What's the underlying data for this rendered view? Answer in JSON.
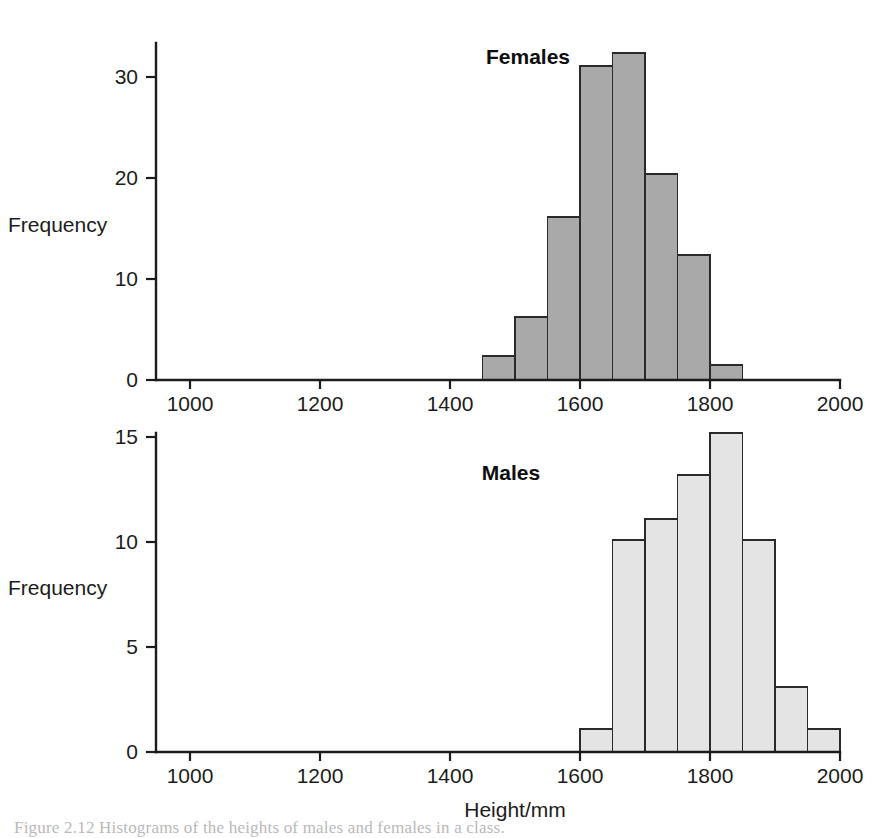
{
  "figure": {
    "background_color": "#ffffff",
    "axis_color": "#1c1c1c",
    "caption_partial": "Figure 2.12 Histograms of the heights of males and females in a class."
  },
  "axes": {
    "x_label": "Height/mm",
    "y_label": "Frequency",
    "x_ticks": [
      1000,
      1200,
      1400,
      1600,
      1800,
      2000
    ],
    "x_tick_labels": [
      "1000",
      "1200",
      "1400",
      "1600",
      "1800",
      "2000"
    ],
    "top_y_ticks": [
      0,
      10,
      20,
      30
    ],
    "top_y_tick_labels": [
      "0",
      "10",
      "20",
      "30"
    ],
    "bottom_y_ticks": [
      0,
      5,
      10,
      15
    ],
    "bottom_y_tick_labels": [
      "0",
      "5",
      "10",
      "15"
    ]
  },
  "chart_data": [
    {
      "type": "bar",
      "title": "Females",
      "xlabel": "",
      "ylabel": "Frequency",
      "xlim": [
        950,
        2000
      ],
      "ylim": [
        0,
        33
      ],
      "xtick_values": [
        1000,
        1200,
        1400,
        1600,
        1800,
        2000
      ],
      "ytick_values": [
        0,
        10,
        20,
        30
      ],
      "grid": false,
      "legend": "none",
      "bin_width": 50,
      "bar_fill_color": "#a9a9a9",
      "bar_edge_color": "#2a2a2a",
      "bins": [
        {
          "x0": 1450,
          "x1": 1500,
          "value": 2.4
        },
        {
          "x0": 1500,
          "x1": 1550,
          "value": 6.2
        },
        {
          "x0": 1550,
          "x1": 1600,
          "value": 16.1
        },
        {
          "x0": 1600,
          "x1": 1650,
          "value": 31.1
        },
        {
          "x0": 1650,
          "x1": 1700,
          "value": 32.4
        },
        {
          "x0": 1700,
          "x1": 1750,
          "value": 20.4
        },
        {
          "x0": 1750,
          "x1": 1800,
          "value": 12.4
        },
        {
          "x0": 1800,
          "x1": 1850,
          "value": 1.5
        }
      ],
      "categories": [
        "1450-1500",
        "1500-1550",
        "1550-1600",
        "1600-1650",
        "1650-1700",
        "1700-1750",
        "1750-1800",
        "1800-1850"
      ],
      "values": [
        2.4,
        6.2,
        16.1,
        31.1,
        32.4,
        20.4,
        12.4,
        1.5
      ]
    },
    {
      "type": "bar",
      "title": "Males",
      "xlabel": "Height/mm",
      "ylabel": "Frequency",
      "xlim": [
        950,
        2000
      ],
      "ylim": [
        0,
        15.5
      ],
      "xtick_values": [
        1000,
        1200,
        1400,
        1600,
        1800,
        2000
      ],
      "ytick_values": [
        0,
        5,
        10,
        15
      ],
      "grid": false,
      "legend": "none",
      "bin_width": 50,
      "bar_fill_color": "#e4e4e4",
      "bar_edge_color": "#2a2a2a",
      "bins": [
        {
          "x0": 1600,
          "x1": 1650,
          "value": 1.1
        },
        {
          "x0": 1650,
          "x1": 1700,
          "value": 10.1
        },
        {
          "x0": 1700,
          "x1": 1750,
          "value": 11.1
        },
        {
          "x0": 1750,
          "x1": 1800,
          "value": 13.2
        },
        {
          "x0": 1800,
          "x1": 1850,
          "value": 15.2
        },
        {
          "x0": 1850,
          "x1": 1900,
          "value": 10.1
        },
        {
          "x0": 1900,
          "x1": 1950,
          "value": 3.1
        },
        {
          "x0": 1950,
          "x1": 2000,
          "value": 1.1
        }
      ],
      "categories": [
        "1600-1650",
        "1650-1700",
        "1700-1750",
        "1750-1800",
        "1800-1850",
        "1850-1900",
        "1900-1950",
        "1950-2000"
      ],
      "values": [
        1.1,
        10.1,
        11.1,
        13.2,
        15.2,
        10.1,
        3.1,
        1.1
      ]
    }
  ]
}
